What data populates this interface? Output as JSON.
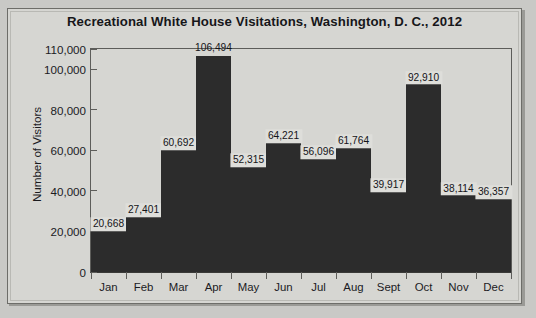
{
  "chart_data": {
    "type": "bar",
    "title": "Recreational White House Visitations, Washington, D. C., 2012",
    "xlabel": "",
    "ylabel": "Number of Visitors",
    "categories": [
      "Jan",
      "Feb",
      "Mar",
      "Apr",
      "May",
      "Jun",
      "Jul",
      "Aug",
      "Sept",
      "Oct",
      "Nov",
      "Dec"
    ],
    "values": [
      20668,
      27401,
      60692,
      106494,
      52315,
      64221,
      56096,
      61764,
      39917,
      92910,
      38114,
      36357
    ],
    "value_labels": [
      "20,668",
      "27,401",
      "60,692",
      "106,494",
      "52,315",
      "64,221",
      "56,096",
      "61,764",
      "39,917",
      "92,910",
      "38,114",
      "36,357"
    ],
    "ylim": [
      0,
      110000
    ],
    "yticks": [
      0,
      20000,
      40000,
      60000,
      80000,
      100000,
      110000
    ],
    "ytick_labels": [
      "0",
      "20,000",
      "40,000",
      "60,000",
      "80,000",
      "100,000",
      "110,000"
    ],
    "grid": false,
    "legend": false,
    "bar_color": "#2c2c2c",
    "plot_background": "#d6d6d2",
    "axis_color": "#5d5d5a",
    "text_color": "#1b1b1f"
  }
}
